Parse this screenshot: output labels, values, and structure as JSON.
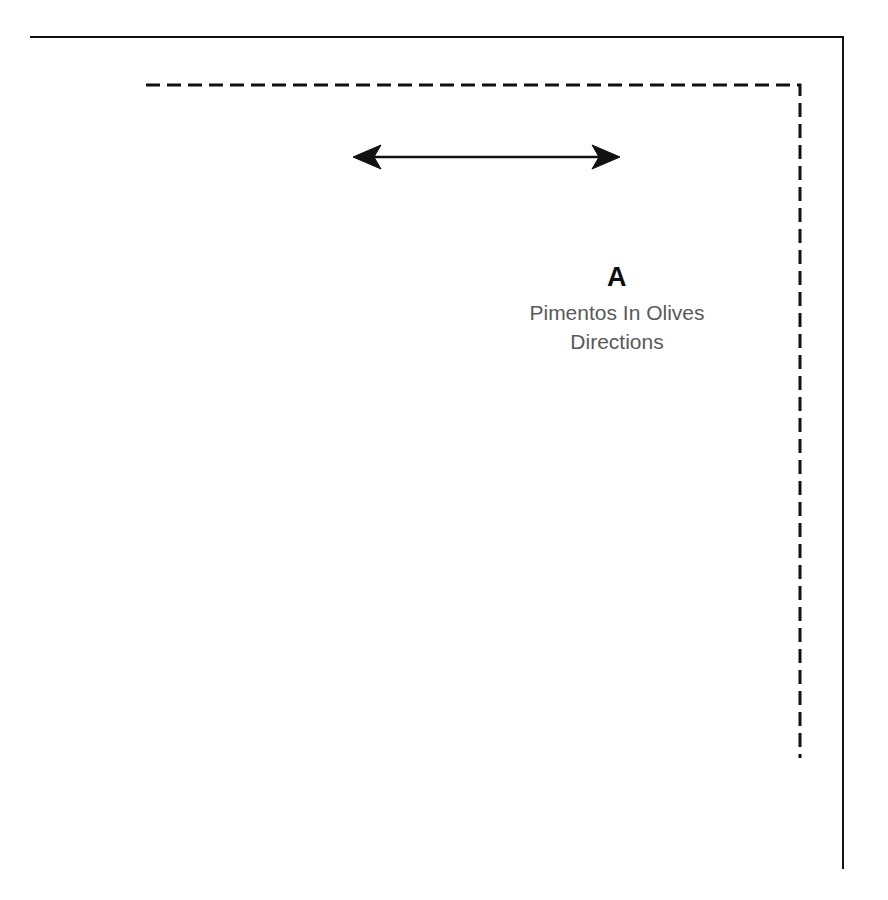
{
  "canvas": {
    "width": 888,
    "height": 900,
    "background_color": "#ffffff"
  },
  "diagram": {
    "title_letter": "A",
    "caption_line_1": "Pimentos In Olives",
    "caption_line_2": "Directions",
    "stroke_color": "#111111",
    "caption_color": "#595959",
    "letter_color": "#0d0d0d",
    "outer_triangle": {
      "name": "solid-right-triangle",
      "style": "solid",
      "stroke_width": 2,
      "points": "31,37 843,37 843,868"
    },
    "inner_triangle": {
      "name": "dashed-right-triangle",
      "style": "dashed",
      "stroke_width": 3,
      "dash_pattern": "14 7",
      "points": "146,85 800,85 800,758"
    },
    "arrow": {
      "name": "double-headed-horizontal-arrow",
      "x1": 353,
      "x2": 620,
      "y": 157,
      "shaft_width": 2,
      "head_length": 24,
      "head_half_height": 11,
      "double_headed": true
    }
  }
}
